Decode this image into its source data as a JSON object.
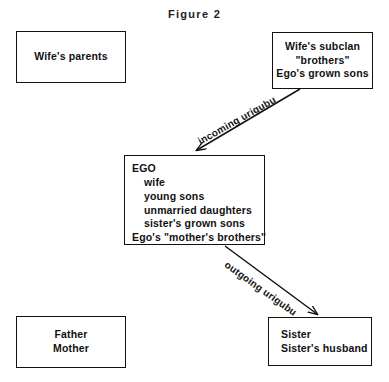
{
  "figure": {
    "title": "Figure 2"
  },
  "boxes": {
    "wifes_parents": {
      "name": "Wife's parents",
      "lines": [
        "Wife's parents"
      ]
    },
    "wifes_subclan": {
      "name": "Wife's subclan",
      "lines": [
        "Wife's subclan",
        "\"brothers\"",
        "Ego's grown sons"
      ]
    },
    "ego": {
      "name": "EGO",
      "lines": [
        "EGO",
        "wife",
        "young sons",
        "unmarried daughters",
        "sister's grown sons",
        "Ego's \"mother's brothers\""
      ]
    },
    "father_mother": {
      "name": "Father Mother",
      "lines": [
        "Father",
        "Mother"
      ]
    },
    "sister": {
      "name": "Sister",
      "lines": [
        "Sister",
        "Sister's husband"
      ]
    }
  },
  "arrows": {
    "incoming": {
      "label": "incoming urigubu",
      "from": "wifes_subclan",
      "to": "ego"
    },
    "outgoing": {
      "label": "outgoing urigubu",
      "from": "ego",
      "to": "sister"
    }
  },
  "colors": {
    "ink": "#111111",
    "background": "#ffffff"
  }
}
